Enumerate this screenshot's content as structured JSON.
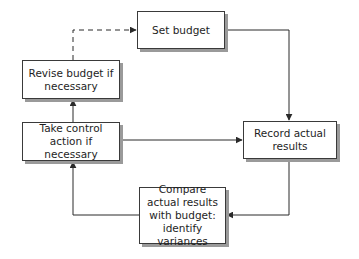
{
  "diagram": {
    "type": "flowchart",
    "title": "",
    "nodes": [
      {
        "id": "set_budget",
        "label": "Set budget"
      },
      {
        "id": "record_actual",
        "label": "Record actual results"
      },
      {
        "id": "compare",
        "label": "Compare actual results with budget: identify variances"
      },
      {
        "id": "take_control",
        "label": "Take control action if necessary"
      },
      {
        "id": "revise_budget",
        "label": "Revise budget if necessary"
      }
    ],
    "edges": [
      {
        "from": "set_budget",
        "to": "record_actual",
        "style": "solid"
      },
      {
        "from": "record_actual",
        "to": "compare",
        "style": "solid"
      },
      {
        "from": "compare",
        "to": "take_control",
        "style": "solid"
      },
      {
        "from": "take_control",
        "to": "record_actual",
        "style": "solid"
      },
      {
        "from": "take_control",
        "to": "revise_budget",
        "style": "solid"
      },
      {
        "from": "revise_budget",
        "to": "set_budget",
        "style": "dashed"
      }
    ]
  },
  "labels": {
    "set_budget": "Set budget",
    "record_actual": "Record actual results",
    "compare": "Compare actual results with budget: identify variances",
    "take_control": "Take control action if necessary",
    "revise_budget": "Revise budget if necessary"
  },
  "colors": {
    "line": "#2a2a2a",
    "box_border": "#3a3a3a",
    "shadow": "#9a9a9a",
    "text": "#1e1e1e",
    "background": "#ffffff"
  }
}
